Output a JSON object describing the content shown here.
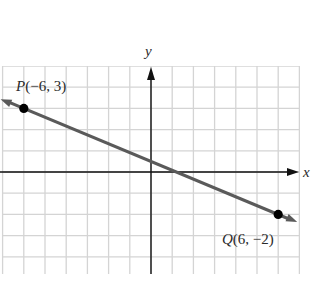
{
  "figure": {
    "axes": {
      "x_label": "x",
      "y_label": "y"
    },
    "grid": {
      "x_min": -7,
      "x_max": 7,
      "y_min": -5,
      "y_max": 5,
      "step": 1
    },
    "points": [
      {
        "name": "P",
        "x": -6,
        "y": 3,
        "label": "P(−6, 3)"
      },
      {
        "name": "Q",
        "x": 6,
        "y": -2,
        "label": "Q(6, −2)"
      }
    ],
    "line": {
      "through": [
        "P",
        "Q"
      ],
      "color": "#5a5a5a"
    },
    "colors": {
      "grid": "#d4d4d4",
      "axis": "#111111",
      "line": "#5a5a5a",
      "point": "#000000"
    }
  },
  "chart_data": {
    "type": "line",
    "title": "",
    "xlabel": "x",
    "ylabel": "y",
    "xlim": [
      -7,
      7
    ],
    "ylim": [
      -5,
      5
    ],
    "grid": true,
    "series": [
      {
        "name": "line PQ",
        "x": [
          -6,
          6
        ],
        "y": [
          3,
          -2
        ]
      }
    ],
    "annotations": [
      "P(−6, 3)",
      "Q(6, −2)"
    ]
  }
}
